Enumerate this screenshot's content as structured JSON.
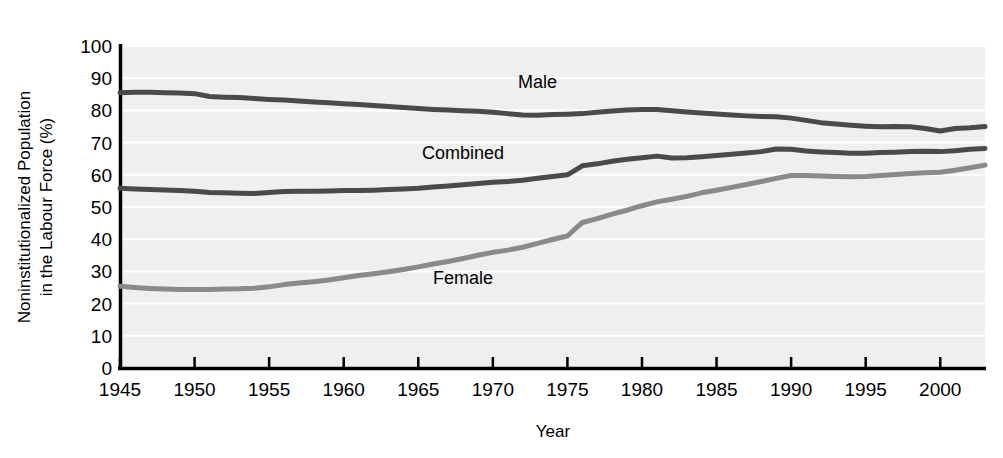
{
  "chart_data": {
    "type": "line",
    "title": "",
    "xlabel": "Year",
    "ylabel": "Noninstitutionalized Population in the Labour Force (%)",
    "ylabel_line1": "Noninstitutionalized Population",
    "ylabel_line2": "in the Labour Force (%)",
    "xlim": [
      1945,
      2003
    ],
    "ylim": [
      0,
      100
    ],
    "ytick_labels": [
      "100",
      "90",
      "80",
      "70",
      "60",
      "50",
      "40",
      "30",
      "20",
      "10",
      "0"
    ],
    "ytick_values": [
      100,
      90,
      80,
      70,
      60,
      50,
      40,
      30,
      20,
      10,
      0
    ],
    "xtick_labels": [
      "1945",
      "1950",
      "1955",
      "1960",
      "1965",
      "1970",
      "1975",
      "1980",
      "1985",
      "1990",
      "1995",
      "2000"
    ],
    "xtick_values": [
      1945,
      1950,
      1955,
      1960,
      1965,
      1970,
      1975,
      1980,
      1985,
      1990,
      1995,
      2000
    ],
    "grid": "horizontal-white-on-gray",
    "legend": "inline-annotations",
    "plot_background": "#efefef",
    "series": [
      {
        "name": "Male",
        "color": "#4a4a4a",
        "label_x": 1973,
        "label_y": 87,
        "x": [
          1945,
          1946,
          1947,
          1948,
          1949,
          1950,
          1951,
          1952,
          1953,
          1954,
          1955,
          1956,
          1957,
          1958,
          1959,
          1960,
          1961,
          1962,
          1963,
          1964,
          1965,
          1966,
          1967,
          1968,
          1969,
          1970,
          1971,
          1972,
          1973,
          1974,
          1975,
          1976,
          1977,
          1978,
          1979,
          1980,
          1981,
          1982,
          1983,
          1984,
          1985,
          1986,
          1987,
          1988,
          1989,
          1990,
          1991,
          1992,
          1993,
          1994,
          1995,
          1996,
          1997,
          1998,
          1999,
          2000,
          2001,
          2002,
          2003
        ],
        "values": [
          85.5,
          85.6,
          85.6,
          85.5,
          85.4,
          85.2,
          84.3,
          84.1,
          84.0,
          83.7,
          83.4,
          83.2,
          82.9,
          82.6,
          82.4,
          82.1,
          81.8,
          81.5,
          81.2,
          80.9,
          80.6,
          80.3,
          80.1,
          79.9,
          79.7,
          79.4,
          79.0,
          78.6,
          78.5,
          78.7,
          78.8,
          79.0,
          79.4,
          79.8,
          80.1,
          80.3,
          80.3,
          79.9,
          79.5,
          79.2,
          78.9,
          78.6,
          78.3,
          78.1,
          78.0,
          77.6,
          76.9,
          76.2,
          75.8,
          75.4,
          75.1,
          74.9,
          75.0,
          74.9,
          74.4,
          73.6,
          74.4,
          74.6,
          75.0
        ]
      },
      {
        "name": "Combined",
        "color": "#4a4a4a",
        "label_x": 1968,
        "label_y": 65,
        "x": [
          1945,
          1946,
          1947,
          1948,
          1949,
          1950,
          1951,
          1952,
          1953,
          1954,
          1955,
          1956,
          1957,
          1958,
          1959,
          1960,
          1961,
          1962,
          1963,
          1964,
          1965,
          1966,
          1967,
          1968,
          1969,
          1970,
          1971,
          1972,
          1973,
          1974,
          1975,
          1976,
          1977,
          1978,
          1979,
          1980,
          1981,
          1982,
          1983,
          1984,
          1985,
          1986,
          1987,
          1988,
          1989,
          1990,
          1991,
          1992,
          1993,
          1994,
          1995,
          1996,
          1997,
          1998,
          1999,
          2000,
          2001,
          2002,
          2003
        ],
        "values": [
          55.8,
          55.6,
          55.4,
          55.3,
          55.1,
          54.9,
          54.5,
          54.4,
          54.3,
          54.2,
          54.5,
          54.8,
          54.9,
          54.9,
          55.0,
          55.1,
          55.1,
          55.2,
          55.4,
          55.6,
          55.8,
          56.2,
          56.5,
          56.9,
          57.3,
          57.7,
          57.9,
          58.3,
          58.9,
          59.5,
          60.0,
          62.8,
          63.4,
          64.2,
          64.8,
          65.3,
          65.8,
          65.2,
          65.3,
          65.6,
          66.0,
          66.4,
          66.8,
          67.2,
          68.0,
          67.9,
          67.4,
          67.1,
          66.9,
          66.7,
          66.7,
          66.9,
          67.0,
          67.2,
          67.3,
          67.2,
          67.5,
          67.9,
          68.2
        ]
      },
      {
        "name": "Female",
        "color": "#8a8a8a",
        "label_x": 1968,
        "label_y": 26,
        "x": [
          1945,
          1946,
          1947,
          1948,
          1949,
          1950,
          1951,
          1952,
          1953,
          1954,
          1955,
          1956,
          1957,
          1958,
          1959,
          1960,
          1961,
          1962,
          1963,
          1964,
          1965,
          1966,
          1967,
          1968,
          1969,
          1970,
          1971,
          1972,
          1973,
          1974,
          1975,
          1976,
          1977,
          1978,
          1979,
          1980,
          1981,
          1982,
          1983,
          1984,
          1985,
          1986,
          1987,
          1988,
          1989,
          1990,
          1991,
          1992,
          1993,
          1994,
          1995,
          1996,
          1997,
          1998,
          1999,
          2000,
          2001,
          2002,
          2003
        ],
        "values": [
          25.4,
          25.0,
          24.7,
          24.5,
          24.4,
          24.4,
          24.4,
          24.5,
          24.6,
          24.8,
          25.2,
          25.9,
          26.4,
          26.8,
          27.3,
          28.0,
          28.7,
          29.3,
          29.9,
          30.6,
          31.4,
          32.3,
          33.1,
          34.0,
          35.0,
          35.9,
          36.6,
          37.5,
          38.7,
          39.9,
          41.0,
          45.2,
          46.4,
          47.8,
          49.0,
          50.4,
          51.6,
          52.4,
          53.3,
          54.4,
          55.2,
          56.1,
          57.0,
          57.9,
          58.9,
          59.8,
          59.8,
          59.6,
          59.5,
          59.4,
          59.5,
          59.8,
          60.1,
          60.4,
          60.6,
          60.8,
          61.4,
          62.2,
          63.0
        ]
      }
    ]
  }
}
